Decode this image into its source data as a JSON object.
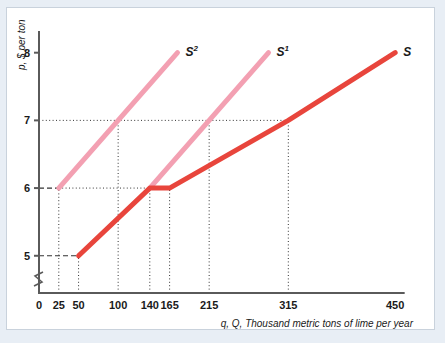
{
  "figure": {
    "background_color": "#e8eef5",
    "card_color": "#ffffff",
    "border_color": "#c9d2dc"
  },
  "chart_data": {
    "type": "line",
    "title": "",
    "xlabel": "q, Q, Thousand metric tons of lime per year",
    "ylabel": "p, $ per ton",
    "xlim": [
      0,
      470
    ],
    "ylim": [
      4.45,
      8.35
    ],
    "grid": false,
    "axis_break": true,
    "legend_position": "inline-curve-labels",
    "xticks": [
      {
        "value": 0,
        "label": "0"
      },
      {
        "value": 25,
        "label": "25"
      },
      {
        "value": 50,
        "label": "50"
      },
      {
        "value": 100,
        "label": "100"
      },
      {
        "value": 140,
        "label": "140"
      },
      {
        "value": 165,
        "label": "165"
      },
      {
        "value": 215,
        "label": "215"
      },
      {
        "value": 315,
        "label": "315"
      },
      {
        "value": 450,
        "label": "450"
      }
    ],
    "yticks": [
      {
        "value": 5,
        "label": "5"
      },
      {
        "value": 6,
        "label": "6"
      },
      {
        "value": 7,
        "label": "7"
      },
      {
        "value": 8,
        "label": "8"
      }
    ],
    "series": [
      {
        "name": "S2",
        "label": "S",
        "superscript": "2",
        "color": "#f3a0b2",
        "width": 5,
        "points": [
          [
            25,
            6
          ],
          [
            100,
            7
          ],
          [
            175,
            8
          ]
        ]
      },
      {
        "name": "S1",
        "label": "S",
        "superscript": "1",
        "color": "#f3a0b2",
        "width": 5,
        "points": [
          [
            140,
            6
          ],
          [
            215,
            7
          ],
          [
            290,
            8
          ]
        ]
      },
      {
        "name": "S",
        "label": "S",
        "superscript": "",
        "color": "#e8453c",
        "width": 5,
        "points": [
          [
            50,
            5
          ],
          [
            140,
            6
          ],
          [
            165,
            6
          ],
          [
            315,
            7
          ],
          [
            450,
            8
          ]
        ]
      }
    ],
    "dotted_guides": [
      {
        "from": [
          25,
          4.45
        ],
        "to": [
          25,
          6
        ]
      },
      {
        "from": [
          50,
          4.45
        ],
        "to": [
          50,
          5
        ]
      },
      {
        "from": [
          100,
          4.45
        ],
        "to": [
          100,
          7
        ]
      },
      {
        "from": [
          140,
          4.45
        ],
        "to": [
          140,
          6
        ]
      },
      {
        "from": [
          165,
          4.45
        ],
        "to": [
          165,
          6
        ]
      },
      {
        "from": [
          215,
          4.45
        ],
        "to": [
          215,
          7
        ]
      },
      {
        "from": [
          315,
          4.45
        ],
        "to": [
          315,
          7
        ]
      },
      {
        "from": [
          0,
          7
        ],
        "to": [
          315,
          7
        ]
      },
      {
        "from": [
          25,
          6
        ],
        "to": [
          165,
          6
        ]
      }
    ],
    "dashed_guides": [
      {
        "from": [
          0,
          6
        ],
        "to": [
          25,
          6
        ]
      },
      {
        "from": [
          0,
          5
        ],
        "to": [
          50,
          5
        ]
      }
    ]
  }
}
